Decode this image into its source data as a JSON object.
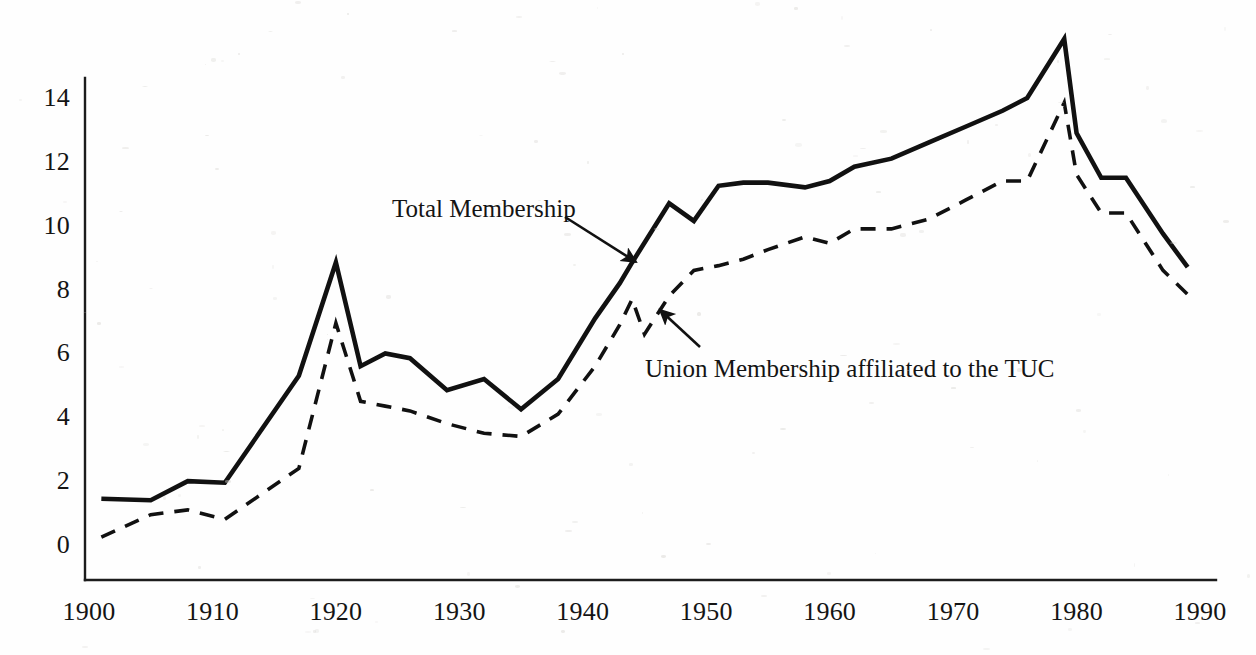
{
  "chart_data": {
    "type": "line",
    "title": "",
    "subtitle": "",
    "xlabel": "",
    "ylabel": "",
    "xlim": [
      1900,
      1990
    ],
    "ylim": [
      0,
      14
    ],
    "grid": false,
    "legend_position": "inline-annotations",
    "units": "millions",
    "x_ticks": [
      "1900",
      "1910",
      "1920",
      "1930",
      "1940",
      "1950",
      "1960",
      "1970",
      "1980",
      "1990"
    ],
    "x_tick_values": [
      1900,
      1910,
      1920,
      1930,
      1940,
      1950,
      1960,
      1970,
      1980,
      1990
    ],
    "y_ticks": [
      "0",
      "2",
      "4",
      "6",
      "8",
      "10",
      "12",
      "14"
    ],
    "y_tick_values": [
      0,
      2,
      4,
      6,
      8,
      10,
      12,
      14
    ],
    "series": [
      {
        "name": "Total Membership",
        "style": "solid",
        "color": "#111111",
        "x": [
          1901,
          1905,
          1908,
          1911,
          1917,
          1920,
          1922,
          1924,
          1926,
          1929,
          1932,
          1935,
          1938,
          1941,
          1943,
          1944,
          1947,
          1949,
          1951,
          1953,
          1955,
          1958,
          1960,
          1962,
          1965,
          1968,
          1971,
          1974,
          1976,
          1979,
          1980,
          1982,
          1984,
          1987,
          1989
        ],
        "values": [
          1.45,
          1.4,
          2.0,
          1.95,
          5.3,
          8.85,
          5.6,
          6.0,
          5.85,
          4.85,
          5.2,
          4.25,
          5.2,
          7.1,
          8.2,
          8.85,
          10.7,
          10.15,
          11.25,
          11.35,
          11.35,
          11.2,
          11.4,
          11.85,
          12.1,
          12.6,
          13.1,
          13.6,
          14.0,
          15.85,
          12.9,
          11.5,
          11.5,
          9.75,
          8.7
        ]
      },
      {
        "name": "Union Membership affiliated to the TUC",
        "style": "dashed",
        "color": "#111111",
        "x": [
          1901,
          1905,
          1908,
          1911,
          1917,
          1920,
          1922,
          1924,
          1926,
          1929,
          1932,
          1935,
          1938,
          1941,
          1943,
          1944,
          1945,
          1947,
          1949,
          1951,
          1953,
          1955,
          1958,
          1960,
          1962,
          1965,
          1968,
          1971,
          1974,
          1976,
          1979,
          1980,
          1982,
          1984,
          1987,
          1989
        ],
        "values": [
          0.25,
          0.95,
          1.1,
          0.8,
          2.4,
          6.95,
          4.5,
          4.35,
          4.2,
          3.8,
          3.5,
          3.4,
          4.1,
          5.6,
          6.9,
          7.7,
          6.6,
          7.8,
          8.6,
          8.75,
          8.95,
          9.25,
          9.65,
          9.45,
          9.9,
          9.9,
          10.2,
          10.8,
          11.4,
          11.4,
          13.85,
          11.6,
          10.4,
          10.4,
          8.6,
          7.85
        ]
      }
    ],
    "annotations": [
      {
        "text": "Total Membership",
        "label_x": 392,
        "label_y": 195,
        "arrow_from_x": 565,
        "arrow_from_y": 217,
        "arrow_to_x": 636,
        "arrow_to_y": 262
      },
      {
        "text": "Union Membership affiliated to the TUC",
        "label_x": 645,
        "label_y": 355,
        "arrow_from_x": 700,
        "arrow_from_y": 347,
        "arrow_to_x": 660,
        "arrow_to_y": 310
      }
    ]
  }
}
